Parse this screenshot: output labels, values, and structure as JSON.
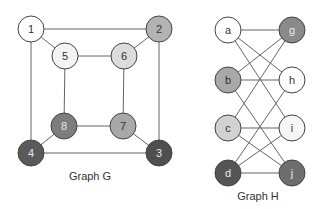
{
  "graphs": [
    {
      "title": "Graph G",
      "title_pos": [
        90,
        180
      ],
      "nodes": [
        {
          "id": "1",
          "x": 31,
          "y": 29,
          "fill": "#ffffff",
          "text": "#333333"
        },
        {
          "id": "2",
          "x": 159,
          "y": 29,
          "fill": "#b3b3b3",
          "text": "#333333"
        },
        {
          "id": "5",
          "x": 65,
          "y": 56,
          "fill": "#f4f4f4",
          "text": "#333333"
        },
        {
          "id": "6",
          "x": 124,
          "y": 56,
          "fill": "#dcdcdc",
          "text": "#333333"
        },
        {
          "id": "8",
          "x": 64,
          "y": 126,
          "fill": "#7d7d7d",
          "text": "#e8e8e8"
        },
        {
          "id": "7",
          "x": 123,
          "y": 126,
          "fill": "#a8a8a8",
          "text": "#333333"
        },
        {
          "id": "4",
          "x": 31,
          "y": 153,
          "fill": "#5a5a5a",
          "text": "#e8e8e8"
        },
        {
          "id": "3",
          "x": 159,
          "y": 153,
          "fill": "#4f4f4f",
          "text": "#e8e8e8"
        }
      ],
      "edges": [
        [
          "1",
          "2"
        ],
        [
          "1",
          "5"
        ],
        [
          "1",
          "4"
        ],
        [
          "2",
          "6"
        ],
        [
          "2",
          "3"
        ],
        [
          "5",
          "6"
        ],
        [
          "5",
          "8"
        ],
        [
          "6",
          "7"
        ],
        [
          "8",
          "7"
        ],
        [
          "8",
          "4"
        ],
        [
          "7",
          "3"
        ],
        [
          "4",
          "3"
        ]
      ]
    },
    {
      "title": "Graph H",
      "title_pos": [
        258,
        200
      ],
      "nodes": [
        {
          "id": "a",
          "x": 228,
          "y": 30,
          "fill": "#ffffff",
          "text": "#333333"
        },
        {
          "id": "g",
          "x": 292,
          "y": 30,
          "fill": "#8a8a8a",
          "text": "#e8e8e8"
        },
        {
          "id": "b",
          "x": 228,
          "y": 80,
          "fill": "#a8a8a8",
          "text": "#333333"
        },
        {
          "id": "h",
          "x": 292,
          "y": 80,
          "fill": "#ffffff",
          "text": "#333333"
        },
        {
          "id": "c",
          "x": 228,
          "y": 128,
          "fill": "#d2d2d2",
          "text": "#333333"
        },
        {
          "id": "i",
          "x": 292,
          "y": 128,
          "fill": "#f6f6f6",
          "text": "#333333"
        },
        {
          "id": "d",
          "x": 228,
          "y": 173,
          "fill": "#555555",
          "text": "#e8e8e8"
        },
        {
          "id": "j",
          "x": 292,
          "y": 173,
          "fill": "#6e6e6e",
          "text": "#e8e8e8"
        }
      ],
      "edges": [
        [
          "a",
          "g"
        ],
        [
          "a",
          "h"
        ],
        [
          "a",
          "i"
        ],
        [
          "b",
          "g"
        ],
        [
          "b",
          "h"
        ],
        [
          "b",
          "j"
        ],
        [
          "c",
          "g"
        ],
        [
          "c",
          "i"
        ],
        [
          "c",
          "j"
        ],
        [
          "d",
          "h"
        ],
        [
          "d",
          "i"
        ],
        [
          "d",
          "j"
        ]
      ]
    }
  ],
  "node_radius": 13
}
